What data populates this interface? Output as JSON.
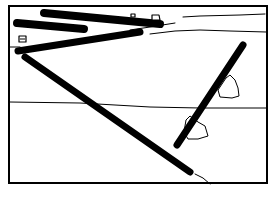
{
  "diagram": {
    "width": 279,
    "height": 204,
    "colors": {
      "ink": "#000000",
      "paper": "#ffffff"
    },
    "frame": {
      "x": 9,
      "y": 6,
      "w": 258,
      "h": 177,
      "stroke": 2
    },
    "ground_lines": [
      {
        "id": "upper-bank-top",
        "points": "183,17 200,16 240,15 265,14",
        "stroke": 1
      },
      {
        "id": "upper-bank-bottom",
        "points": "150,34 175,31 200,30 230,31 266,32",
        "stroke": 1
      },
      {
        "id": "slope-line",
        "points": "130,30 150,27 175,23",
        "stroke": 1
      },
      {
        "id": "left-edge-line",
        "points": "9,47 20,47",
        "stroke": 1
      },
      {
        "id": "water-line",
        "points": "9,102 80,103 150,107 200,108 267,108",
        "stroke": 1
      },
      {
        "id": "pole-tail-line",
        "points": "195,174 203,178 210,184",
        "stroke": 1
      }
    ],
    "poles": [
      {
        "id": "top-pole-long",
        "x1": 44,
        "y1": 13,
        "x2": 160,
        "y2": 24,
        "w": 8
      },
      {
        "id": "top-pole-short",
        "x1": 17,
        "y1": 23,
        "x2": 84,
        "y2": 29,
        "w": 8
      },
      {
        "id": "bank-pole",
        "x1": 18,
        "y1": 51,
        "x2": 140,
        "y2": 32,
        "w": 7
      },
      {
        "id": "diagonal-pole",
        "x1": 25,
        "y1": 57,
        "x2": 190,
        "y2": 172,
        "w": 7
      },
      {
        "id": "right-pole",
        "x1": 243,
        "y1": 45,
        "x2": 177,
        "y2": 145,
        "w": 7
      }
    ],
    "anchors": [
      {
        "id": "anchor-top-right",
        "d": "M152,20 L152,15 L159,15 L160,20 Z"
      },
      {
        "id": "anchor-top-small",
        "d": "M131,17 L131,14 L135,14 L135,17 Z"
      },
      {
        "id": "anchor-left",
        "d": "M19,42 L19,36 L26,36 L26,42 Z M20,39 L25,39"
      }
    ],
    "rocks": [
      {
        "id": "rock-upper",
        "d": "M226,78 L230,75 L235,80 L238,88 L239,96 L232,98 L220,97 L218,90 Z"
      },
      {
        "id": "rock-lower",
        "d": "M186,120 L190,116 L198,122 L205,126 L208,136 L198,139 L188,139 L184,132 Z"
      }
    ]
  }
}
